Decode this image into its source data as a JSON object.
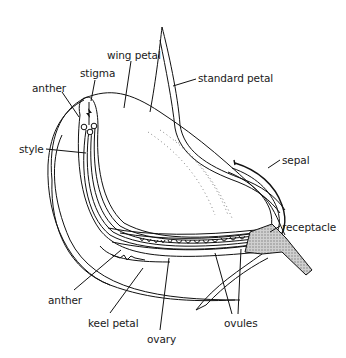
{
  "diagram": {
    "labels": [
      {
        "id": "wing-petal",
        "text": "wing petal",
        "x": 107,
        "y": 49
      },
      {
        "id": "stigma",
        "text": "stigma",
        "x": 80,
        "y": 69
      },
      {
        "id": "anther-top",
        "text": "anther",
        "x": 32,
        "y": 84
      },
      {
        "id": "standard-petal",
        "text": "standard petal",
        "x": 198,
        "y": 73
      },
      {
        "id": "style",
        "text": "style",
        "x": 19,
        "y": 145
      },
      {
        "id": "sepal",
        "text": "sepal",
        "x": 282,
        "y": 156
      },
      {
        "id": "receptacle",
        "text": "receptacle",
        "x": 282,
        "y": 222
      },
      {
        "id": "anther-bottom",
        "text": "anther",
        "x": 48,
        "y": 295
      },
      {
        "id": "keel-petal",
        "text": "keel petal",
        "x": 88,
        "y": 319
      },
      {
        "id": "ovules",
        "text": "ovules",
        "x": 224,
        "y": 318
      },
      {
        "id": "ovary",
        "text": "ovary",
        "x": 147,
        "y": 335
      }
    ],
    "colors": {
      "line": "#111111",
      "receptacle_fill": "#bdbdbd",
      "background": "#ffffff"
    }
  }
}
